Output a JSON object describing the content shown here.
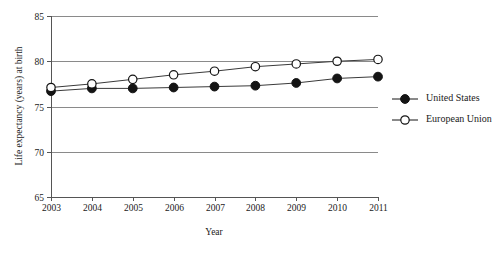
{
  "chart_data": {
    "type": "line",
    "title": "",
    "xlabel": "Year",
    "ylabel": "Life expectancy (years) at birth",
    "x": [
      2003,
      2004,
      2005,
      2006,
      2007,
      2008,
      2009,
      2010,
      2011
    ],
    "xtick_labels": [
      "2003",
      "2004",
      "2005",
      "2006",
      "2007",
      "2008",
      "2009",
      "2010",
      "2011"
    ],
    "ytick_labels": [
      "65",
      "70",
      "75",
      "80",
      "85"
    ],
    "yticks": [
      65,
      70,
      75,
      80,
      85
    ],
    "ylim": [
      65,
      85
    ],
    "xlim": [
      2003,
      2011
    ],
    "grid": "horizontal",
    "legend_position": "right",
    "series": [
      {
        "name": "United States",
        "marker": "filled-circle",
        "values": [
          76.7,
          77.0,
          77.0,
          77.1,
          77.2,
          77.3,
          77.6,
          78.1,
          78.3
        ]
      },
      {
        "name": "European Union",
        "marker": "open-circle",
        "values": [
          77.1,
          77.5,
          78.0,
          78.5,
          78.9,
          79.4,
          79.7,
          80.0,
          80.2
        ]
      }
    ]
  },
  "legend": {
    "items": [
      {
        "label": "United States",
        "marker": "filled-circle"
      },
      {
        "label": "European Union",
        "marker": "open-circle"
      }
    ]
  }
}
